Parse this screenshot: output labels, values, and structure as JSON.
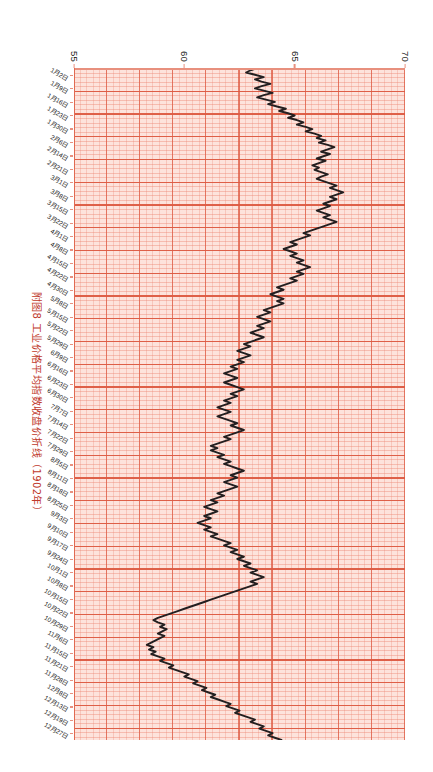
{
  "figure": {
    "caption": "附图8  工业价格平均指数收盘价折线（1902年）",
    "caption_color": "#c0392b"
  },
  "chart_data": {
    "type": "line",
    "title": "附图8  工业价格平均指数收盘价折线（1902年）",
    "xlabel": "",
    "ylabel": "",
    "orientation": "rotated-90-clockwise",
    "grid": true,
    "legend": "none",
    "background_color": "#fde3dc",
    "gridline_color": "#dd5a42",
    "line_color": "#231f20",
    "ylim": [
      55,
      70
    ],
    "yticks": [
      70,
      65,
      60,
      55
    ],
    "ytick_labels": [
      "70",
      "65",
      "60",
      "55"
    ],
    "xtick_labels": [
      "1月2日",
      "1月9日",
      "1月16日",
      "1月23日",
      "1月30日",
      "2月6日",
      "2月14日",
      "2月21日",
      "3月1日",
      "3月8日",
      "3月15日",
      "3月22日",
      "4月1日",
      "4月8日",
      "4月15日",
      "4月22日",
      "4月30日",
      "5月8日",
      "5月15日",
      "5月22日",
      "5月29日",
      "6月9日",
      "6月16日",
      "6月23日",
      "6月30日",
      "7月7日",
      "7月14日",
      "7月22日",
      "7月29日",
      "8月5日",
      "8月11日",
      "8月18日",
      "8月25日",
      "9月3日",
      "9月10日",
      "9月17日",
      "9月24日",
      "10月1日",
      "10月8日",
      "10月15日",
      "10月22日",
      "10月29日",
      "11月6日",
      "11月15日",
      "11月21日",
      "11月28日",
      "12月8日",
      "12月13日",
      "12月19日",
      "12月27日"
    ],
    "x": [
      0,
      1,
      2,
      3,
      4,
      5,
      6,
      7,
      8,
      9,
      10,
      11,
      12,
      13,
      14,
      15,
      16,
      17,
      18,
      19,
      20,
      21,
      22,
      23,
      24,
      25,
      26,
      27,
      28,
      29,
      30,
      31,
      32,
      33,
      34,
      35,
      36,
      37,
      38,
      39,
      40,
      41,
      42,
      43,
      44,
      45,
      46,
      47,
      48,
      49,
      50,
      51,
      52,
      53,
      54,
      55,
      56,
      57,
      58,
      59,
      60,
      61,
      62,
      63,
      64,
      65,
      66,
      67,
      68,
      69,
      70,
      71,
      72,
      73,
      74,
      75,
      76,
      77,
      78,
      79,
      80,
      81,
      82,
      83,
      84,
      85,
      86,
      87,
      88,
      89,
      90,
      91,
      92,
      93,
      94,
      95,
      96,
      97,
      98,
      99,
      100,
      101,
      102,
      103,
      104,
      105,
      106,
      107,
      108,
      109,
      110,
      111,
      112,
      113,
      114,
      115,
      116,
      117,
      118,
      119,
      120,
      121,
      122,
      123,
      124,
      125,
      126,
      127,
      128,
      129,
      130,
      131,
      132,
      133,
      134,
      135,
      136,
      137,
      138,
      139,
      140,
      141,
      142,
      143,
      144,
      145,
      146,
      147,
      148,
      149,
      150,
      151,
      152,
      153,
      154,
      155,
      156,
      157,
      158,
      159,
      160,
      161,
      162,
      163,
      164,
      165,
      166,
      167,
      168,
      169,
      170,
      171,
      172,
      173,
      174,
      175,
      176,
      177,
      178,
      179,
      180,
      181,
      182,
      183,
      184,
      185,
      186,
      187,
      188,
      189,
      190,
      191,
      192,
      193,
      194,
      195,
      196,
      197,
      198,
      199,
      200,
      201,
      202,
      203,
      204,
      205,
      206,
      207,
      208,
      209,
      210,
      211,
      212,
      213,
      214,
      215,
      216,
      217,
      218,
      219,
      220,
      221,
      222,
      223,
      224,
      225,
      226,
      227,
      228,
      229,
      230,
      231,
      232,
      233,
      234,
      235,
      236,
      237,
      238,
      239,
      240,
      241,
      242,
      243,
      244,
      245,
      246,
      247,
      248,
      249,
      250,
      251,
      252,
      253,
      254,
      255,
      256,
      257,
      258,
      259,
      260,
      261,
      262,
      263,
      264,
      265,
      266,
      267,
      268,
      269,
      270,
      271,
      272,
      273,
      274,
      275,
      276,
      277,
      278,
      279,
      280,
      281,
      282,
      283,
      284,
      285,
      286,
      287,
      288,
      289,
      290,
      291,
      292,
      293,
      294,
      295,
      296,
      297
    ],
    "values": [
      63.3,
      63.0,
      62.8,
      63.2,
      63.6,
      63.2,
      63.5,
      63.9,
      63.5,
      63.2,
      63.6,
      64.0,
      63.6,
      63.3,
      63.7,
      64.1,
      63.8,
      64.2,
      64.6,
      64.3,
      64.7,
      65.0,
      64.7,
      65.1,
      65.4,
      65.1,
      65.5,
      65.8,
      65.5,
      65.9,
      66.2,
      66.0,
      66.4,
      66.1,
      66.5,
      66.8,
      66.5,
      66.2,
      66.6,
      66.3,
      66.0,
      66.4,
      66.1,
      65.8,
      66.1,
      65.9,
      66.2,
      66.5,
      66.2,
      66.0,
      66.3,
      66.6,
      66.9,
      66.6,
      66.9,
      67.2,
      66.9,
      66.6,
      66.9,
      66.6,
      66.3,
      66.6,
      66.3,
      66.0,
      66.3,
      66.6,
      66.3,
      66.6,
      66.9,
      66.6,
      66.3,
      66.0,
      65.7,
      65.4,
      65.7,
      65.4,
      65.1,
      64.8,
      65.1,
      64.8,
      64.5,
      64.8,
      65.1,
      64.8,
      65.1,
      65.4,
      65.1,
      65.4,
      65.7,
      65.4,
      65.1,
      65.4,
      65.1,
      64.8,
      65.1,
      64.8,
      64.5,
      64.2,
      64.5,
      64.2,
      63.9,
      64.2,
      64.5,
      64.2,
      64.5,
      64.2,
      63.9,
      63.6,
      63.9,
      63.6,
      63.3,
      63.6,
      63.9,
      63.6,
      63.3,
      63.6,
      63.3,
      63.0,
      63.3,
      63.6,
      63.3,
      63.0,
      62.7,
      63.0,
      62.7,
      62.4,
      62.7,
      63.0,
      62.7,
      62.4,
      62.7,
      62.4,
      62.1,
      62.4,
      62.1,
      61.8,
      62.1,
      62.4,
      62.1,
      61.8,
      62.1,
      62.4,
      62.7,
      62.4,
      62.1,
      62.4,
      62.1,
      61.8,
      62.1,
      61.8,
      61.5,
      61.8,
      62.1,
      61.8,
      61.5,
      61.8,
      62.1,
      62.4,
      62.1,
      62.4,
      62.7,
      62.4,
      62.1,
      61.8,
      62.1,
      61.8,
      61.5,
      61.2,
      61.5,
      61.2,
      61.5,
      61.8,
      61.5,
      61.8,
      62.1,
      61.8,
      62.1,
      62.4,
      62.7,
      62.4,
      62.1,
      62.4,
      62.1,
      61.8,
      62.1,
      62.4,
      62.1,
      61.8,
      61.5,
      61.8,
      61.5,
      61.2,
      61.5,
      61.2,
      60.9,
      61.2,
      61.5,
      61.2,
      60.9,
      61.2,
      60.9,
      60.6,
      60.9,
      61.2,
      60.9,
      61.2,
      61.5,
      61.2,
      61.5,
      61.8,
      62.1,
      61.8,
      62.1,
      62.4,
      62.1,
      62.4,
      62.7,
      62.4,
      62.7,
      63.0,
      62.7,
      63.0,
      63.3,
      63.0,
      63.3,
      63.6,
      63.3,
      63.0,
      63.3,
      63.0,
      62.7,
      62.4,
      62.1,
      61.8,
      61.5,
      61.2,
      60.9,
      60.6,
      60.3,
      60.0,
      59.7,
      59.4,
      59.1,
      58.8,
      58.6,
      58.8,
      59.1,
      58.9,
      59.2,
      59.0,
      58.8,
      59.1,
      58.9,
      58.7,
      58.5,
      58.3,
      58.6,
      58.4,
      58.7,
      58.5,
      58.8,
      59.1,
      58.9,
      59.2,
      59.5,
      59.3,
      59.6,
      59.9,
      60.2,
      60.0,
      60.3,
      60.6,
      60.4,
      60.7,
      61.0,
      60.8,
      61.1,
      61.4,
      61.2,
      61.5,
      61.8,
      62.1,
      61.9,
      62.2,
      62.5,
      62.3,
      62.6,
      62.9,
      63.2,
      63.0,
      63.3,
      63.6,
      63.4,
      63.7,
      64.0,
      63.8,
      64.1,
      64.4
    ]
  }
}
